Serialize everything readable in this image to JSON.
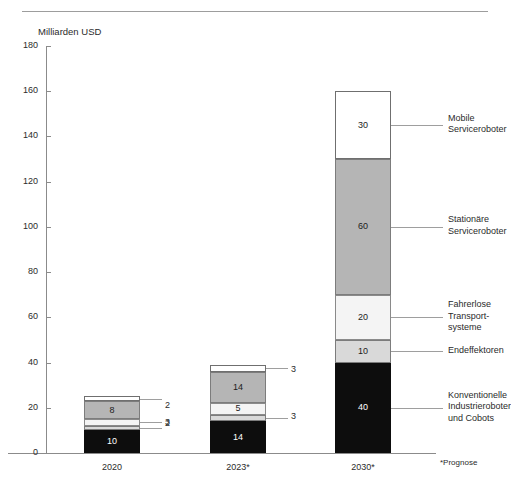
{
  "header": {
    "cut_text_left": "",
    "cut_text_right": ""
  },
  "axis_title": "Milliarden USD",
  "footnote": "*Prognose",
  "bottom_caption": "",
  "chart_data": {
    "type": "bar",
    "subtype": "stacked",
    "title": "",
    "xlabel": "",
    "ylabel": "Milliarden USD",
    "ylim": [
      0,
      180
    ],
    "yticks": [
      0,
      20,
      40,
      60,
      80,
      100,
      120,
      140,
      160,
      180
    ],
    "ytick_labels": [
      "0",
      "20",
      "40",
      "60",
      "80",
      "100",
      "120",
      "140",
      "160",
      "180"
    ],
    "grid": false,
    "legend_position": "right",
    "categories": [
      "2020",
      "2023*",
      "2030*"
    ],
    "totals": [
      25,
      39,
      160
    ],
    "series": [
      {
        "name": "Konventionelle Industrieroboter und Cobots",
        "legend_label": "Konventionelle\nIndustrieroboter\nund Cobots",
        "color": "#0d0d0d",
        "values": [
          10,
          14,
          40
        ],
        "labels": [
          "10",
          "14",
          "40"
        ],
        "label_inside": [
          true,
          true,
          true
        ]
      },
      {
        "name": "Endeffektoren",
        "legend_label": "Endeffektoren",
        "color": "#d9d9d9",
        "values": [
          2,
          3,
          10
        ],
        "labels": [
          "2",
          "3",
          "10"
        ],
        "label_inside": [
          false,
          false,
          true
        ]
      },
      {
        "name": "Fahrerlose Transportsysteme",
        "legend_label": "Fahrerlose\nTransport-\nsysteme",
        "color": "#f4f4f4",
        "values": [
          3,
          5,
          20
        ],
        "labels": [
          "3",
          "5",
          "20"
        ],
        "label_inside": [
          false,
          true,
          true
        ]
      },
      {
        "name": "Stationäre Serviceroboter",
        "legend_label": "Stationäre\nServiceroboter",
        "color": "#b5b5b5",
        "values": [
          8,
          14,
          60
        ],
        "labels": [
          "8",
          "14",
          "60"
        ],
        "label_inside": [
          true,
          true,
          true
        ]
      },
      {
        "name": "Mobile Serviceroboter",
        "legend_label": "Mobile\nServiceroboter",
        "color": "#ffffff",
        "values": [
          2,
          3,
          30
        ],
        "labels": [
          "2",
          "3",
          "30"
        ],
        "label_inside": [
          false,
          false,
          true
        ]
      }
    ]
  }
}
